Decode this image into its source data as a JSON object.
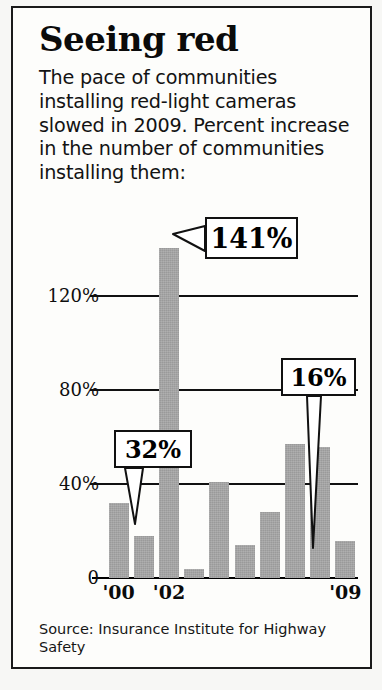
{
  "headline": "Seeing red",
  "deck": "The pace of communities installing red-light cameras slowed in 2009. Percent increase in the number of communities installing them:",
  "source": "Source: Insurance Institute for Highway Safety",
  "callouts": [
    {
      "id": "141",
      "label": "141%"
    },
    {
      "id": "32",
      "label": "32%"
    },
    {
      "id": "16",
      "label": "16%"
    }
  ],
  "chart_data": {
    "type": "bar",
    "title": "Seeing red",
    "subtitle": "The pace of communities installing red-light cameras slowed in 2009. Percent increase in the number of communities installing them:",
    "xlabel": "",
    "ylabel": "",
    "categories": [
      "'00",
      "'01",
      "'02",
      "'03",
      "'04",
      "'05",
      "'06",
      "'07",
      "'08",
      "'09"
    ],
    "values": [
      32,
      18,
      141,
      4,
      41,
      14,
      28,
      57,
      56,
      16
    ],
    "ylim": [
      0,
      160
    ],
    "yticks": [
      0,
      40,
      80,
      120
    ],
    "ytick_labels": [
      "0",
      "40%",
      "80%",
      "120%"
    ],
    "xtick_labels": [
      "'00",
      "'02",
      "'09"
    ],
    "xtick_categories": [
      "'00",
      "'02",
      "'09"
    ],
    "grid": true,
    "legend": false,
    "bar_color": "#9a9a9a",
    "annotations": [
      {
        "category": "'02",
        "value": 141,
        "text": "141%"
      },
      {
        "category": "'00",
        "value": 32,
        "text": "32%"
      },
      {
        "category": "'09",
        "value": 16,
        "text": "16%"
      }
    ],
    "source": "Source: Insurance Institute for Highway Safety"
  }
}
